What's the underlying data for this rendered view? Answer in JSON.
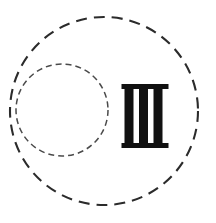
{
  "figure": {
    "background_color": "#ffffff",
    "ink_color": "#1a1a1a",
    "width": 216,
    "height": 223,
    "title": "Roman numeral three inside two dashed circles",
    "shapes": {
      "outer_circle": {
        "name": "outer-dashed-circle",
        "cx": 104,
        "cy": 111,
        "r": 94,
        "stroke_color": "#2b2b2b",
        "stroke_width": 2.1,
        "dash_pattern": "11 7",
        "fill": "none"
      },
      "inner_circle": {
        "name": "inner-dashed-circle",
        "cx": 62,
        "cy": 110,
        "r": 46,
        "stroke_color": "#4a4a4a",
        "stroke_width": 1.5,
        "dash_pattern": "6 4",
        "fill": "none"
      },
      "numeral": {
        "name": "roman-numeral-three",
        "value": "III",
        "arabic_value": "3",
        "color": "#111111",
        "left": 122,
        "right": 168,
        "top": 84,
        "bottom": 148,
        "serif_bar_height": 5,
        "stroke_count": 3,
        "stroke_width": 9,
        "stroke_gap": 5.5,
        "stems": [
          {
            "x": 124.5,
            "width": 9
          },
          {
            "x": 139.0,
            "width": 9
          },
          {
            "x": 153.5,
            "width": 9
          }
        ],
        "top_bar": {
          "x": 121.5,
          "y": 84,
          "width": 47,
          "height": 5
        },
        "bottom_bar": {
          "x": 121.5,
          "y": 143,
          "width": 47,
          "height": 5
        }
      }
    }
  }
}
